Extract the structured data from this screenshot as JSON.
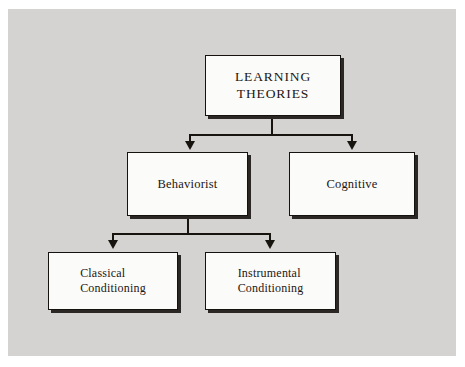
{
  "figure": {
    "kind": "hierarchy-flowchart",
    "background_color": "#d4d3d1",
    "page_color": "#ffffff",
    "box_fill": "#fbfbfa",
    "line_color": "#17140f",
    "shadow_color": "#2a2724"
  },
  "nodes": {
    "root": {
      "line1": "LEARNING",
      "line2": "THEORIES"
    },
    "behaviorist": {
      "label": "Behaviorist"
    },
    "cognitive": {
      "label": "Cognitive"
    },
    "classical": {
      "line1": "Classical",
      "line2": "Conditioning"
    },
    "instrumental": {
      "line1": "Instrumental",
      "line2": "Conditioning"
    }
  },
  "edges": [
    {
      "from": "root",
      "to": "behaviorist",
      "style": "elbow-arrow"
    },
    {
      "from": "root",
      "to": "cognitive",
      "style": "elbow-arrow"
    },
    {
      "from": "behaviorist",
      "to": "classical",
      "style": "elbow-arrow"
    },
    {
      "from": "behaviorist",
      "to": "instrumental",
      "style": "elbow-arrow"
    }
  ]
}
